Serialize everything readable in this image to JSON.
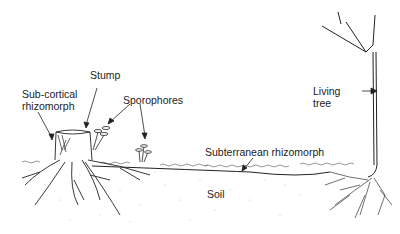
{
  "diagram": {
    "labels": {
      "stump": "Stump",
      "subcortical_line1": "Sub-cortical",
      "subcortical_line2": "rhizomorph",
      "sporophores": "Sporophores",
      "living_line1": "Living",
      "living_line2": "tree",
      "subterranean": "Subterranean rhizomorph",
      "soil": "Soil"
    },
    "colors": {
      "ink": "#222222",
      "soil_dots": "#b8b8b8",
      "background": "#ffffff"
    }
  }
}
